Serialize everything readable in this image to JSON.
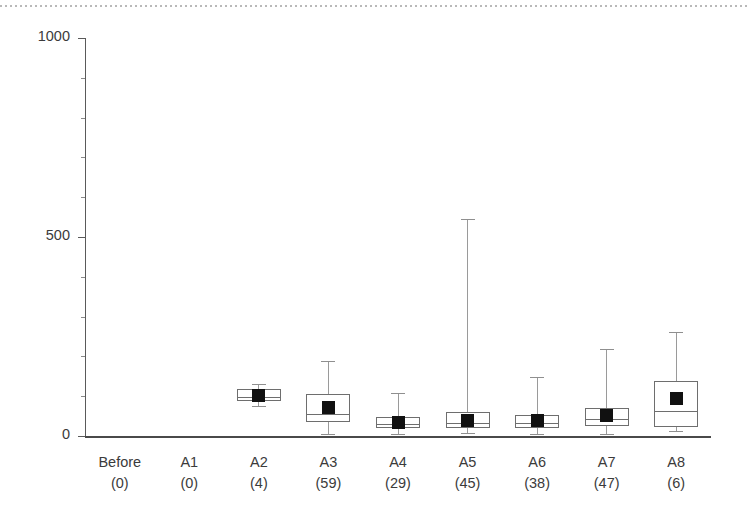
{
  "chart_data": {
    "type": "box",
    "title": "",
    "xlabel": "",
    "ylabel": "",
    "ylim": [
      0,
      1000
    ],
    "yticks": [
      0,
      500,
      1000
    ],
    "ytick_labels": [
      "0",
      "500",
      "1000"
    ],
    "yminor_ticks": [
      100,
      200,
      300,
      400,
      600,
      700,
      800,
      900
    ],
    "grid": false,
    "legend": "none",
    "categories": [
      {
        "name": "Before",
        "count": "(0)",
        "n": 0
      },
      {
        "name": "A1",
        "count": "(0)",
        "n": 0
      },
      {
        "name": "A2",
        "count": "(4)",
        "n": 4
      },
      {
        "name": "A3",
        "count": "(59)",
        "n": 59
      },
      {
        "name": "A4",
        "count": "(29)",
        "n": 29
      },
      {
        "name": "A5",
        "count": "(45)",
        "n": 45
      },
      {
        "name": "A6",
        "count": "(38)",
        "n": 38
      },
      {
        "name": "A7",
        "count": "(47)",
        "n": 47
      },
      {
        "name": "A8",
        "count": "(6)",
        "n": 6
      }
    ],
    "boxes": [
      {
        "category": "Before",
        "present": false,
        "whisker_low": null,
        "q1": null,
        "median": null,
        "q3": null,
        "whisker_high": null,
        "mean": null
      },
      {
        "category": "A1",
        "present": false,
        "whisker_low": null,
        "q1": null,
        "median": null,
        "q3": null,
        "whisker_high": null,
        "mean": null
      },
      {
        "category": "A2",
        "present": true,
        "whisker_low": 75,
        "q1": 88,
        "median": 98,
        "q3": 118,
        "whisker_high": 130,
        "mean": 103
      },
      {
        "category": "A3",
        "present": true,
        "whisker_low": 5,
        "q1": 35,
        "median": 55,
        "q3": 105,
        "whisker_high": 188,
        "mean": 72
      },
      {
        "category": "A4",
        "present": true,
        "whisker_low": 5,
        "q1": 20,
        "median": 30,
        "q3": 48,
        "whisker_high": 108,
        "mean": 35
      },
      {
        "category": "A5",
        "present": true,
        "whisker_low": 8,
        "q1": 20,
        "median": 32,
        "q3": 60,
        "whisker_high": 545,
        "mean": 40
      },
      {
        "category": "A6",
        "present": true,
        "whisker_low": 5,
        "q1": 20,
        "median": 33,
        "q3": 52,
        "whisker_high": 148,
        "mean": 38
      },
      {
        "category": "A7",
        "present": true,
        "whisker_low": 5,
        "q1": 25,
        "median": 42,
        "q3": 70,
        "whisker_high": 218,
        "mean": 52
      },
      {
        "category": "A8",
        "present": true,
        "whisker_low": 12,
        "q1": 22,
        "median": 62,
        "q3": 138,
        "whisker_high": 262,
        "mean": 95
      }
    ],
    "style": {
      "box_fill": "#ffffff",
      "box_stroke": "#6e6e6e",
      "whisker_color": "#9a9a9a",
      "mean_marker_color": "#111111",
      "mean_marker_shape": "square",
      "axis_color": "#4a4a4a",
      "text_color": "#3b3b3b",
      "background": "#ffffff",
      "top_border_color": "#b9b9b9"
    }
  }
}
